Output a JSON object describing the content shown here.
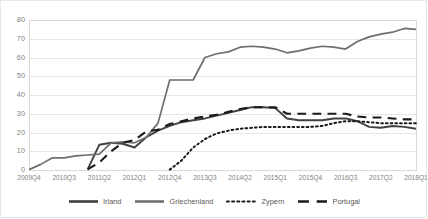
{
  "chart_data": {
    "type": "line",
    "title": "",
    "xlabel": "",
    "ylabel": "",
    "ylim": [
      0,
      80
    ],
    "ytick_values": [
      0,
      10,
      20,
      30,
      40,
      50,
      60,
      70,
      80
    ],
    "grid": true,
    "legend_position": "bottom",
    "x": [
      "2009Q4",
      "2010Q1",
      "2010Q2",
      "2010Q3",
      "2010Q4",
      "2011Q1",
      "2011Q2",
      "2011Q3",
      "2011Q4",
      "2012Q1",
      "2012Q2",
      "2012Q3",
      "2012Q4",
      "2013Q1",
      "2013Q2",
      "2013Q3",
      "2013Q4",
      "2014Q1",
      "2014Q2",
      "2014Q3",
      "2014Q4",
      "2015Q1",
      "2015Q2",
      "2015Q3",
      "2015Q4",
      "2016Q1",
      "2016Q2",
      "2016Q3",
      "2016Q4",
      "2017Q1",
      "2017Q2",
      "2017Q3",
      "2017Q4",
      "2018Q1"
    ],
    "xtick_labels": [
      "2009Q4",
      "2010Q3",
      "2011Q2",
      "2012Q1",
      "2012Q4",
      "2013Q3",
      "2014Q2",
      "2015Q1",
      "2015Q4",
      "2016Q3",
      "2017Q2",
      "2018Q1"
    ],
    "xtick_indices": [
      0,
      3,
      6,
      9,
      12,
      15,
      18,
      21,
      24,
      27,
      30,
      33
    ],
    "series": [
      {
        "name": "Irland",
        "style": "solid",
        "color": "#404040",
        "values": [
          null,
          null,
          null,
          null,
          null,
          0.3,
          13.5,
          14.5,
          14.0,
          12.0,
          17.5,
          21.0,
          23.5,
          25.5,
          26.5,
          27.5,
          29.0,
          30.5,
          32.0,
          33.5,
          33.5,
          33.0,
          27.5,
          26.5,
          26.5,
          26.5,
          27.5,
          27.5,
          26.0,
          23.0,
          22.5,
          23.5,
          23.0,
          22.0
        ]
      },
      {
        "name": "Griechenland",
        "style": "solid",
        "color": "#6e6e6e",
        "values": [
          0.2,
          3.0,
          6.5,
          6.5,
          7.5,
          8.0,
          8.5,
          14.5,
          15.0,
          14.5,
          17.5,
          25.0,
          48.0,
          48.0,
          48.0,
          60.0,
          62.0,
          63.0,
          65.5,
          66.0,
          65.5,
          64.5,
          62.5,
          63.5,
          65.0,
          66.0,
          65.5,
          64.5,
          68.5,
          71.0,
          72.5,
          73.5,
          75.5,
          75.0
        ]
      },
      {
        "name": "Zypern",
        "style": "dotted",
        "color": "#1a1a1a",
        "values": [
          null,
          null,
          null,
          null,
          null,
          null,
          null,
          null,
          null,
          null,
          null,
          null,
          0.2,
          5.0,
          12.0,
          16.5,
          19.5,
          21.0,
          22.0,
          22.5,
          23.0,
          23.0,
          23.0,
          23.0,
          23.0,
          23.5,
          25.0,
          26.0,
          26.0,
          25.5,
          25.0,
          25.0,
          25.0,
          25.0
        ]
      },
      {
        "name": "Portugal",
        "style": "dashed",
        "color": "#1a1a1a",
        "values": [
          null,
          null,
          null,
          null,
          null,
          0.3,
          4.0,
          10.0,
          14.5,
          16.0,
          20.5,
          21.5,
          24.5,
          26.0,
          27.5,
          28.5,
          29.5,
          31.0,
          32.5,
          33.5,
          33.5,
          33.5,
          30.0,
          30.0,
          30.0,
          30.0,
          30.0,
          30.0,
          28.5,
          28.0,
          28.0,
          27.5,
          27.0,
          27.0
        ]
      }
    ]
  },
  "legend": {
    "items": [
      {
        "label": "Irland"
      },
      {
        "label": "Griechenland"
      },
      {
        "label": "Zypern"
      },
      {
        "label": "Portugal"
      }
    ]
  }
}
